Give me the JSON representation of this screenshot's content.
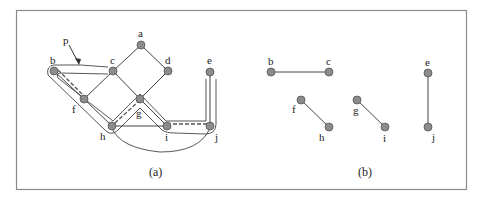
{
  "figure": {
    "frame": {
      "x": 16,
      "y": 10,
      "w": 450,
      "h": 179,
      "color": "#8a8a8a"
    },
    "colors": {
      "edge": "#444444",
      "node_fill": "#8c8c8c",
      "node_stroke": "#555555",
      "path": "#444444"
    },
    "panel_a": {
      "caption": "(a)",
      "nodes": [
        {
          "id": "a",
          "label": "a"
        },
        {
          "id": "b",
          "label": "b"
        },
        {
          "id": "c",
          "label": "c"
        },
        {
          "id": "d",
          "label": "d"
        },
        {
          "id": "e",
          "label": "e"
        },
        {
          "id": "f",
          "label": "f"
        },
        {
          "id": "g",
          "label": "g"
        },
        {
          "id": "h",
          "label": "h"
        },
        {
          "id": "i",
          "label": "i"
        },
        {
          "id": "j",
          "label": "j"
        }
      ],
      "edges": [
        [
          "a",
          "c"
        ],
        [
          "a",
          "d"
        ],
        [
          "b",
          "c"
        ],
        [
          "c",
          "f"
        ],
        [
          "c",
          "g"
        ],
        [
          "d",
          "g"
        ],
        [
          "b",
          "f"
        ],
        [
          "f",
          "h"
        ],
        [
          "g",
          "h"
        ],
        [
          "g",
          "i"
        ],
        [
          "h",
          "i"
        ],
        [
          "i",
          "j"
        ],
        [
          "e",
          "j"
        ],
        [
          "h",
          "j"
        ]
      ],
      "matching_edges_dashed": [
        [
          "b",
          "f"
        ],
        [
          "h",
          "g"
        ],
        [
          "i",
          "j"
        ]
      ],
      "path_label": "p"
    },
    "panel_b": {
      "caption": "(b)",
      "nodes": [
        {
          "id": "b",
          "label": "b"
        },
        {
          "id": "c",
          "label": "c"
        },
        {
          "id": "f",
          "label": "f"
        },
        {
          "id": "h",
          "label": "h"
        },
        {
          "id": "g",
          "label": "g"
        },
        {
          "id": "i",
          "label": "i"
        },
        {
          "id": "e",
          "label": "e"
        },
        {
          "id": "j",
          "label": "j"
        }
      ],
      "edges": [
        [
          "b",
          "c"
        ],
        [
          "f",
          "h"
        ],
        [
          "g",
          "i"
        ],
        [
          "e",
          "j"
        ]
      ]
    }
  }
}
